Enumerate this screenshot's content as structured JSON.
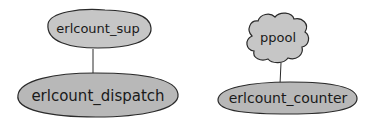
{
  "diagram": {
    "title": "",
    "colors": {
      "node_fill": "#c6c6c6",
      "node_stroke": "#2a2a2a",
      "edge": "#2a2a2a",
      "text": "#1a1a1a",
      "background": "#ffffff"
    },
    "nodes": [
      {
        "id": "erlcount_sup",
        "label": "erlcount_sup",
        "shape": "ellipse"
      },
      {
        "id": "erlcount_dispatch",
        "label": "erlcount_dispatch",
        "shape": "ellipse"
      },
      {
        "id": "ppool",
        "label": "ppool",
        "shape": "cloud"
      },
      {
        "id": "erlcount_counter",
        "label": "erlcount_counter",
        "shape": "ellipse"
      }
    ],
    "edges": [
      {
        "from": "erlcount_sup",
        "to": "erlcount_dispatch"
      },
      {
        "from": "ppool",
        "to": "erlcount_counter"
      }
    ]
  }
}
